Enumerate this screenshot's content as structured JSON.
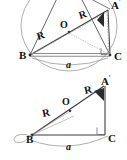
{
  "figure": {
    "colors": {
      "stroke": "#3d3d3d",
      "stroke_light": "#8c8c8c",
      "stroke_dotted": "#9a9a9a",
      "wedge_fill": "#2b2b2b",
      "text": "#111111",
      "background": "#ffffff"
    },
    "panels": [
      {
        "id": "top",
        "name": "circumscribed-circle-panel",
        "labels": {
          "vertex_b": "B",
          "vertex_c": "C",
          "vertex_a_prime": "A",
          "prime_mark": "'",
          "center_o": "O",
          "radius_1": "R",
          "radius_2": "R",
          "side_a": "a"
        },
        "marks": {
          "right_angle_at": "C",
          "filled_wedge_at": "A'"
        }
      },
      {
        "id": "bottom",
        "name": "right-triangle-panel",
        "labels": {
          "vertex_b": "B",
          "vertex_c": "C",
          "vertex_a_prime": "A",
          "prime_mark": "'",
          "center_o": "O",
          "radius_1": "R",
          "radius_2": "R",
          "side_a": "a"
        },
        "marks": {
          "right_angle_at": "C",
          "filled_wedge_at": "A'",
          "loop_at": "B"
        }
      }
    ]
  }
}
